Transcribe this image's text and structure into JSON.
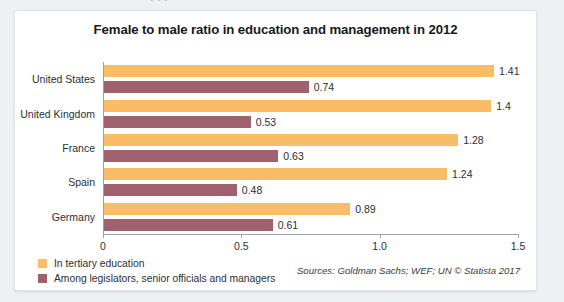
{
  "chart_data": {
    "type": "bar",
    "orientation": "horizontal",
    "title": "Female to male ratio in education and management in 2012",
    "categories": [
      "United States",
      "United Kingdom",
      "France",
      "Spain",
      "Germany"
    ],
    "series": [
      {
        "name": "In tertiary education",
        "color": "#f9bd68",
        "values": [
          1.41,
          1.4,
          1.28,
          1.24,
          0.89
        ],
        "labels": [
          "1.41",
          "1.4",
          "1.28",
          "1.24",
          "0.89"
        ]
      },
      {
        "name": "Among legislators, senior officials and managers",
        "color": "#a0616e",
        "values": [
          0.74,
          0.53,
          0.63,
          0.48,
          0.61
        ],
        "labels": [
          "0.74",
          "0.53",
          "0.63",
          "0.48",
          "0.61"
        ]
      }
    ],
    "xlabel": "",
    "ylabel": "",
    "xlim": [
      0,
      1.5
    ],
    "xticks": [
      0,
      0.5,
      1.0,
      1.5
    ],
    "xtick_labels": [
      "0",
      "0.5",
      "1.0",
      "1.5"
    ],
    "grid": false,
    "legend_position": "bottom-left"
  },
  "source_note": "Sources: Goldman Sachs; WEF; UN © Statista 2017",
  "top_cut_text": "• • •"
}
